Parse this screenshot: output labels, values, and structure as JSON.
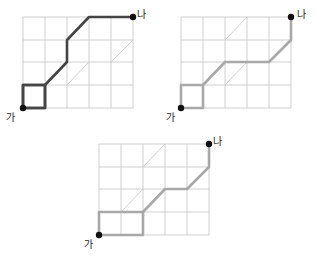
{
  "diagrams": [
    {
      "id": "path-1",
      "start_label": "가",
      "end_label": "나",
      "path_color": "#444444",
      "origin": [
        23,
        108
      ],
      "cell": [
        22.2,
        22.8
      ]
    },
    {
      "id": "path-2",
      "start_label": "가",
      "end_label": "나",
      "path_color": "#a8a8a8",
      "origin": [
        181,
        108
      ],
      "cell": [
        22.0,
        22.8
      ]
    },
    {
      "id": "path-3",
      "start_label": "가",
      "end_label": "나",
      "path_color": "#a8a8a8",
      "origin": [
        99,
        235
      ],
      "cell": [
        22.0,
        22.8
      ]
    }
  ],
  "grid": {
    "columns": 5,
    "rows": 4,
    "line_color": "#bdbdbd"
  }
}
